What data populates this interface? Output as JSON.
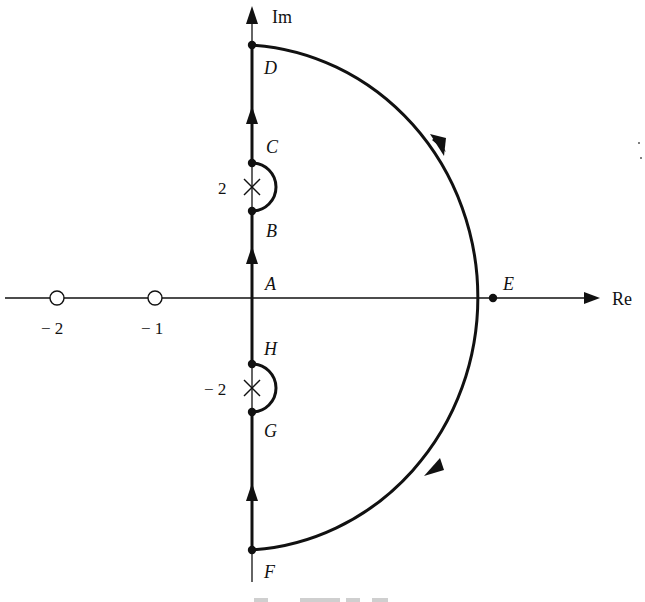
{
  "diagram": {
    "type": "nyquist-contour",
    "axes": {
      "imag_label": "Im",
      "real_label": "Re"
    },
    "points": {
      "A": "A",
      "B": "B",
      "C": "C",
      "D": "D",
      "E": "E",
      "F": "F",
      "G": "G",
      "H": "H"
    },
    "poles": [
      {
        "label": "2",
        "symbol": "×",
        "location": "j2"
      },
      {
        "label": "− 2",
        "symbol": "×",
        "location": "-j2"
      }
    ],
    "zeros": [
      {
        "label": "− 2",
        "symbol": "○",
        "location": "-2"
      },
      {
        "label": "− 1",
        "symbol": "○",
        "location": "-1"
      }
    ],
    "colors": {
      "ink": "#111111",
      "background": "#ffffff"
    }
  }
}
